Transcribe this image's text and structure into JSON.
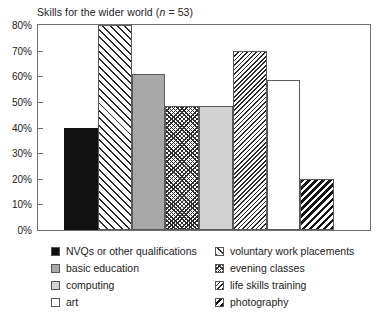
{
  "chart_data": {
    "type": "bar",
    "title": "Skills for the wider world (n = 53)",
    "title_prefix": "Skills for the wider world (",
    "title_italic": "n",
    "title_suffix": " = 53)",
    "xlabel": "",
    "ylabel": "",
    "ylim": [
      0,
      80
    ],
    "grid": false,
    "legend_position": "below",
    "ytick_labels": [
      "80%",
      "70%",
      "60%",
      "50%",
      "40%",
      "30%",
      "20%",
      "10%",
      "0%"
    ],
    "ytick_values": [
      80,
      70,
      60,
      50,
      40,
      30,
      20,
      10,
      0
    ],
    "categories": [
      "NVQs or other qualifications",
      "voluntary work placements",
      "basic education",
      "evening classes",
      "computing",
      "life skills training",
      "art",
      "photography"
    ],
    "values": [
      40,
      80,
      61,
      48.5,
      48.5,
      70,
      58.5,
      20
    ],
    "bars": [
      {
        "label": "NVQs or other qualifications",
        "value": 40,
        "pattern": "solid-black"
      },
      {
        "label": "voluntary work placements",
        "value": 80,
        "pattern": "hatch-wide"
      },
      {
        "label": "basic education",
        "value": 61,
        "pattern": "gray-mid"
      },
      {
        "label": "evening classes",
        "value": 48.5,
        "pattern": "checker"
      },
      {
        "label": "computing",
        "value": 48.5,
        "pattern": "gray-light"
      },
      {
        "label": "life skills training",
        "value": 70,
        "pattern": "hatch-dense"
      },
      {
        "label": "art",
        "value": 58.5,
        "pattern": "white"
      },
      {
        "label": "photography",
        "value": 20,
        "pattern": "hatch-bold"
      }
    ]
  },
  "legend": {
    "left_column": [
      {
        "label": "NVQs or other qualifications",
        "pattern": "solid-black"
      },
      {
        "label": "basic education",
        "pattern": "gray-mid"
      },
      {
        "label": "computing",
        "pattern": "gray-light"
      },
      {
        "label": "art",
        "pattern": "white"
      }
    ],
    "right_column": [
      {
        "label": "voluntary work placements",
        "pattern": "hatch-wide"
      },
      {
        "label": "evening classes",
        "pattern": "checker"
      },
      {
        "label": "life skills training",
        "pattern": "hatch-dense"
      },
      {
        "label": "photography",
        "pattern": "hatch-bold"
      }
    ]
  },
  "colors": {
    "frame": "#6e6e6e",
    "bar_outline": "#5a5a5a",
    "solid_black": "#111111",
    "gray_mid": "#a8a8a8",
    "gray_light": "#d3d3d3",
    "white": "#ffffff",
    "hatch_ink": "#2b2b2b",
    "text": "#222222",
    "background": "#ffffff"
  }
}
